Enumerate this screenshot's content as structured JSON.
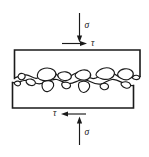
{
  "figure": {
    "colors": {
      "line": "#1a1a1a",
      "fill": "#ffffff",
      "background": "#ffffff"
    },
    "labels": {
      "sigma_top": "σ",
      "tau_top": "τ",
      "tau_bottom": "τ",
      "sigma_bottom": "σ"
    },
    "annotations": {
      "sigma_top_name": "normal-stress-top",
      "tau_top_name": "shear-stress-top",
      "tau_bottom_name": "shear-stress-bottom",
      "sigma_bottom_name": "normal-stress-bottom",
      "sigma_top_direction": "down",
      "tau_top_direction": "right",
      "tau_bottom_direction": "left",
      "sigma_bottom_direction": "up"
    },
    "blocks": [
      {
        "name": "upper-block",
        "position": "top"
      },
      {
        "name": "lower-block",
        "position": "bottom"
      }
    ],
    "interface": {
      "name": "rough-asperity-interface",
      "description": "interlocking irregular grain asperities"
    }
  }
}
